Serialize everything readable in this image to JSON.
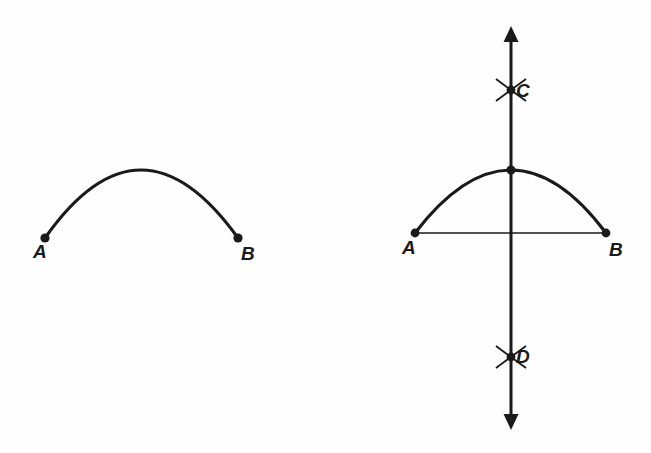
{
  "figure": {
    "background_color": "#fefefe",
    "ink_color": "#1a1a1a",
    "width": 651,
    "height": 453
  },
  "left_diagram": {
    "name": "arc-only",
    "arc": {
      "start": [
        45,
        238
      ],
      "end": [
        238,
        238
      ],
      "apex": [
        141,
        170
      ],
      "stroke_width": 3.2
    },
    "points": [
      {
        "id": "A",
        "label": "A",
        "x": 45,
        "y": 238,
        "label_x": 33,
        "label_y": 258
      },
      {
        "id": "B",
        "label": "B",
        "x": 238,
        "y": 238,
        "label_x": 241,
        "label_y": 260
      }
    ]
  },
  "right_diagram": {
    "name": "arc-with-perpendicular-bisector",
    "arc": {
      "start": [
        415,
        233
      ],
      "end": [
        606,
        233
      ],
      "apex": [
        511,
        170
      ],
      "stroke_width": 3.2
    },
    "chord": {
      "start": [
        415,
        233
      ],
      "end": [
        606,
        233
      ],
      "stroke_width": 1.6
    },
    "vertical_line": {
      "x": 511,
      "top": 26,
      "bottom": 430,
      "stroke_width": 3,
      "arrow_top": true,
      "arrow_bottom": true
    },
    "points": [
      {
        "id": "A",
        "label": "A",
        "x": 415,
        "y": 233,
        "label_x": 402,
        "label_y": 254
      },
      {
        "id": "B",
        "label": "B",
        "x": 606,
        "y": 233,
        "label_x": 609,
        "label_y": 256
      },
      {
        "id": "apex",
        "label": "",
        "x": 511,
        "y": 170,
        "label_x": 0,
        "label_y": 0
      },
      {
        "id": "C",
        "label": "C",
        "x": 511,
        "y": 90,
        "label_x": 516,
        "label_y": 97
      },
      {
        "id": "D",
        "label": "D",
        "x": 511,
        "y": 357,
        "label_x": 516,
        "label_y": 363
      }
    ],
    "cross_marks": [
      {
        "id": "C",
        "cx": 511,
        "cy": 90,
        "half_width": 15,
        "half_height": 11
      },
      {
        "id": "D",
        "cx": 511,
        "cy": 357,
        "half_width": 15,
        "half_height": 11
      }
    ]
  }
}
